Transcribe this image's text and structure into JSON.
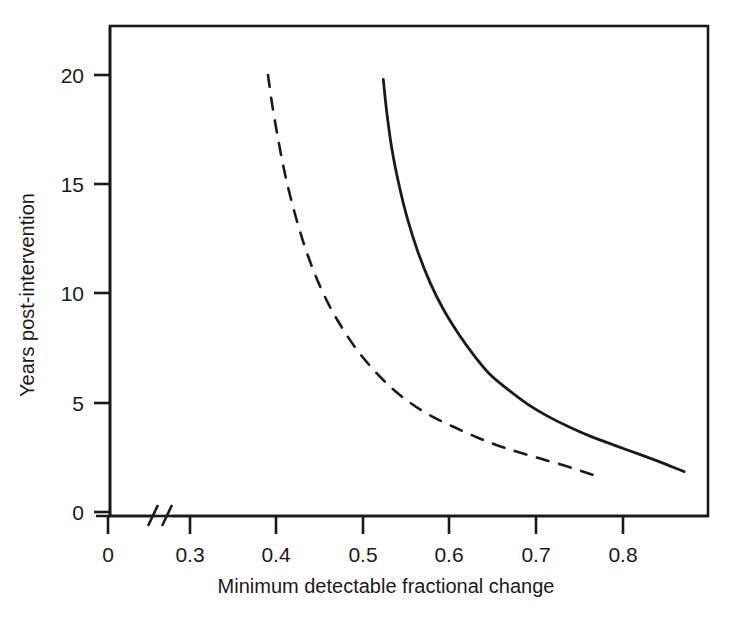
{
  "chart_data": {
    "type": "line",
    "title": "",
    "subtitle": "",
    "xlabel": "Minimum detectable fractional change",
    "ylabel": "Years post-intervention",
    "xlim": [
      0.255,
      0.945
    ],
    "ylim": [
      -0.65,
      22.4
    ],
    "grid": false,
    "legend": "none",
    "axis_break": {
      "axis": "x",
      "symbol": "//",
      "between": [
        0,
        0.3
      ],
      "note": "x-axis has a break between 0 and 0.3"
    },
    "xticks": [
      0,
      0.3,
      0.4,
      0.5,
      0.6,
      0.7,
      0.8
    ],
    "xticklabels": [
      "0",
      "0.3",
      "0.4",
      "0.5",
      "0.6",
      "0.7",
      "0.8"
    ],
    "yticks": [
      0,
      5,
      10,
      15,
      20
    ],
    "yticklabels": [
      "0",
      "5",
      "10",
      "15",
      "20"
    ],
    "series": [
      {
        "name": "dashed-curve",
        "style": "dashed",
        "color": "#1a1a1a",
        "x": [
          0.39,
          0.395,
          0.402,
          0.41,
          0.42,
          0.432,
          0.445,
          0.46,
          0.476,
          0.493,
          0.512,
          0.532,
          0.554,
          0.578,
          0.604,
          0.632,
          0.662,
          0.695,
          0.73,
          0.765
        ],
        "y": [
          20.0,
          18.6,
          17.0,
          15.4,
          13.8,
          12.2,
          10.8,
          9.5,
          8.4,
          7.4,
          6.5,
          5.7,
          5.0,
          4.4,
          3.9,
          3.4,
          2.95,
          2.55,
          2.15,
          1.7
        ]
      },
      {
        "name": "solid-curve",
        "style": "solid",
        "color": "#1a1a1a",
        "x": [
          0.523,
          0.527,
          0.533,
          0.541,
          0.551,
          0.563,
          0.577,
          0.592,
          0.609,
          0.627,
          0.646,
          0.667,
          0.689,
          0.712,
          0.737,
          0.763,
          0.79,
          0.818,
          0.845,
          0.87
        ],
        "y": [
          19.8,
          18.3,
          16.6,
          15.0,
          13.4,
          11.9,
          10.5,
          9.3,
          8.2,
          7.2,
          6.3,
          5.6,
          4.95,
          4.4,
          3.9,
          3.45,
          3.05,
          2.65,
          2.25,
          1.85
        ]
      }
    ]
  },
  "figure": {
    "background_color": "#ffffff",
    "frame_color": "#1a1a1a",
    "axis_color": "#1a1a1a"
  }
}
